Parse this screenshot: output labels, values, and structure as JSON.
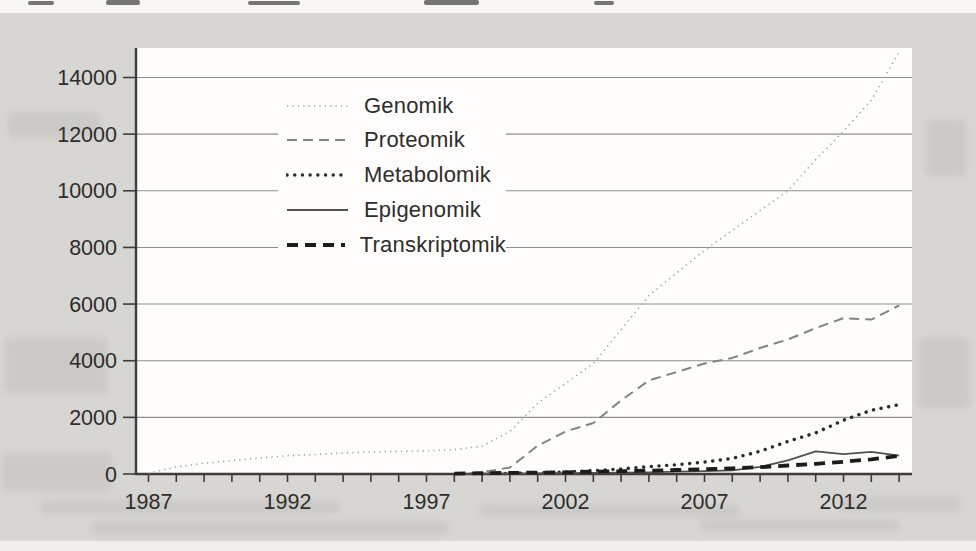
{
  "chart_data": {
    "type": "line",
    "title": "",
    "xlabel": "",
    "ylabel": "",
    "x": [
      1987,
      1988,
      1989,
      1990,
      1991,
      1992,
      1993,
      1994,
      1995,
      1996,
      1997,
      1998,
      1999,
      2000,
      2001,
      2002,
      2003,
      2004,
      2005,
      2006,
      2007,
      2008,
      2009,
      2010,
      2011,
      2012,
      2013,
      2014
    ],
    "x_tick_years": [
      1987,
      1992,
      1997,
      2002,
      2007,
      2012
    ],
    "x_tick_labels": [
      "1987",
      "1992",
      "1997",
      "2002",
      "2007",
      "2012"
    ],
    "y_ticks": [
      0,
      2000,
      4000,
      6000,
      8000,
      10000,
      12000,
      14000
    ],
    "y_tick_labels": [
      "0",
      "2000",
      "4000",
      "6000",
      "8000",
      "10000",
      "12000",
      "14000"
    ],
    "xlim": [
      1987,
      2014
    ],
    "ylim": [
      0,
      15000
    ],
    "grid": "horizontal",
    "legend_position": "inside-top-left",
    "colors": {
      "background_page": "#d7d6d2",
      "plot_area": "#fefdfb",
      "gridline": "#8f8f8d",
      "axis": "#3c3c3a",
      "text": "#2e2d2b"
    },
    "series": [
      {
        "name": "Genomik",
        "style": "fine-dotted",
        "color": "#a0a09e",
        "values": [
          30,
          250,
          380,
          470,
          560,
          650,
          690,
          740,
          780,
          800,
          820,
          860,
          980,
          1500,
          2500,
          3200,
          3900,
          5100,
          6300,
          7100,
          7900,
          8600,
          9300,
          10000,
          11100,
          12100,
          13200,
          14900
        ]
      },
      {
        "name": "Proteomik",
        "style": "dashed",
        "color": "#83837f",
        "values": [
          null,
          null,
          null,
          null,
          null,
          null,
          null,
          null,
          null,
          null,
          null,
          10,
          60,
          230,
          1000,
          1500,
          1800,
          2600,
          3300,
          3600,
          3900,
          4100,
          4450,
          4750,
          5150,
          5500,
          5450,
          5950
        ]
      },
      {
        "name": "Metabolomik",
        "style": "bold-dotted",
        "color": "#2c2c2a",
        "values": [
          null,
          null,
          null,
          null,
          null,
          null,
          null,
          null,
          null,
          null,
          null,
          null,
          10,
          20,
          40,
          70,
          120,
          180,
          260,
          330,
          420,
          550,
          800,
          1150,
          1450,
          1900,
          2250,
          2450
        ]
      },
      {
        "name": "Epigenomik",
        "style": "solid",
        "color": "#52524f",
        "values": [
          null,
          null,
          null,
          null,
          null,
          null,
          null,
          null,
          null,
          null,
          null,
          5,
          10,
          15,
          20,
          30,
          40,
          50,
          60,
          80,
          100,
          130,
          250,
          480,
          800,
          700,
          780,
          650
        ]
      },
      {
        "name": "Transkriptomik",
        "style": "bold-dashed",
        "color": "#1c1c1a",
        "values": [
          null,
          null,
          null,
          null,
          null,
          null,
          null,
          null,
          null,
          null,
          null,
          15,
          30,
          40,
          50,
          60,
          80,
          100,
          120,
          140,
          170,
          200,
          240,
          300,
          360,
          430,
          520,
          640
        ]
      }
    ]
  }
}
